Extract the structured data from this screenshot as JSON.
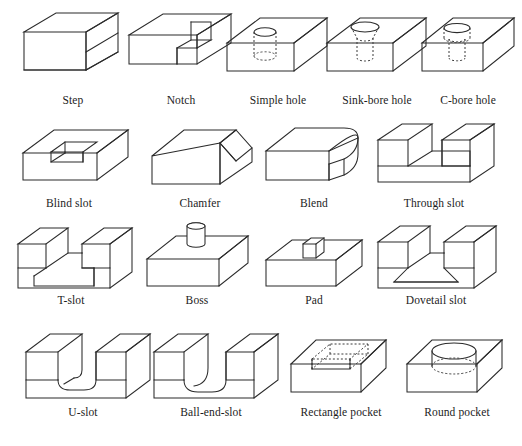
{
  "figure": {
    "columns": 5,
    "rows": 4,
    "line_color": "#2b2b2b",
    "hidden_line_color": "#3a3a3a",
    "background_color": "#ffffff",
    "label_color": "#1c1c1c"
  },
  "features": [
    {
      "id": "step",
      "label": "Step",
      "row": 1,
      "col": 1,
      "icon": "step-block-icon",
      "description": "Rectangular block with a stepped top-right corner removed"
    },
    {
      "id": "notch",
      "label": "Notch",
      "row": 1,
      "col": 2,
      "icon": "notch-block-icon",
      "description": "Rectangular block with a square notch cut into the front-top edge"
    },
    {
      "id": "simple-hole",
      "label": "Simple hole",
      "row": 1,
      "col": 3,
      "icon": "simple-hole-block-icon",
      "description": "Block with a straight cylindrical blind hole, hidden lines dashed"
    },
    {
      "id": "sink-bore-hole",
      "label": "Sink-bore hole",
      "row": 1,
      "col": 4,
      "icon": "sink-bore-hole-block-icon",
      "description": "Block with a countersunk tapered hole entrance above a cylindrical bore"
    },
    {
      "id": "c-bore-hole",
      "label": "C-bore hole",
      "row": 1,
      "col": 5,
      "icon": "c-bore-hole-block-icon",
      "description": "Block with a counterbored hole, large flat-bottom bore over a smaller hole"
    },
    {
      "id": "blind-slot",
      "label": "Blind slot",
      "row": 2,
      "col": 1,
      "icon": "blind-slot-block-icon",
      "description": "Block with a rectangular slot that stops before the far face"
    },
    {
      "id": "chamfer",
      "label": "Chamfer",
      "row": 2,
      "col": 2,
      "icon": "chamfer-block-icon",
      "description": "Block with a flat angled chamfer along the top-right edge"
    },
    {
      "id": "blend",
      "label": "Blend",
      "row": 2,
      "col": 3,
      "icon": "blend-block-icon",
      "description": "Block with a rounded fillet blend along the right vertical edge"
    },
    {
      "id": "through-slot",
      "label": "Through slot",
      "row": 2,
      "col": 4,
      "icon": "through-slot-block-icon",
      "description": "Block with a rectangular slot running fully through front to back"
    },
    {
      "id": "t-slot",
      "label": "T-slot",
      "row": 3,
      "col": 1,
      "icon": "t-slot-block-icon",
      "description": "Block with a T-shaped slot running through the part"
    },
    {
      "id": "boss",
      "label": "Boss",
      "row": 3,
      "col": 2,
      "icon": "boss-block-icon",
      "description": "Block with a raised cylindrical boss on the top face"
    },
    {
      "id": "pad",
      "label": "Pad",
      "row": 3,
      "col": 3,
      "icon": "pad-block-icon",
      "description": "Block with a raised rectangular pad on the top face"
    },
    {
      "id": "dovetail-slot",
      "label": "Dovetail slot",
      "row": 3,
      "col": 4,
      "icon": "dovetail-slot-block-icon",
      "description": "Block with a trapezoidal dovetail slot running through the part"
    },
    {
      "id": "u-slot",
      "label": "U-slot",
      "row": 4,
      "col": 1,
      "icon": "u-slot-block-icon",
      "description": "Block with a U-shaped slot with rounded bottom running through"
    },
    {
      "id": "ball-end-slot",
      "label": "Ball-end-slot",
      "row": 4,
      "col": 2,
      "icon": "ball-end-slot-block-icon",
      "description": "Block with a slot having a ball-shaped rounded end"
    },
    {
      "id": "rectangle-pocket",
      "label": "Rectangle pocket",
      "row": 4,
      "col": 3,
      "icon": "rectangle-pocket-block-icon",
      "description": "Block with a rectangular pocket recessed into the top face, hidden edges dashed"
    },
    {
      "id": "round-pocket",
      "label": "Round pocket",
      "row": 4,
      "col": 4,
      "icon": "round-pocket-block-icon",
      "description": "Block with a large circular pocket recessed into the top face"
    }
  ]
}
